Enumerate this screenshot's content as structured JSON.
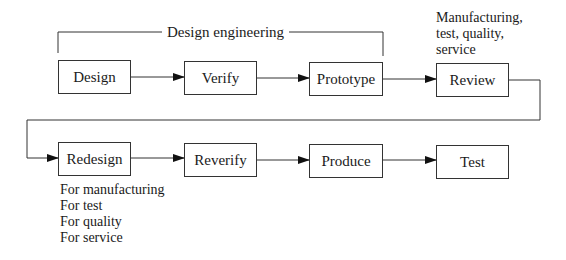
{
  "diagram": {
    "type": "flowchart",
    "bracket": {
      "label": "Design engineering"
    },
    "row1": [
      {
        "id": "design",
        "label": "Design"
      },
      {
        "id": "verify",
        "label": "Verify"
      },
      {
        "id": "prototype",
        "label": "Prototype"
      },
      {
        "id": "review",
        "label": "Review"
      }
    ],
    "row2": [
      {
        "id": "redesign",
        "label": "Redesign"
      },
      {
        "id": "reverify",
        "label": "Reverify"
      },
      {
        "id": "produce",
        "label": "Produce"
      },
      {
        "id": "test",
        "label": "Test"
      }
    ],
    "review_annotation": [
      "Manufacturing,",
      "test, quality,",
      "service"
    ],
    "redesign_annotation": [
      "For manufacturing",
      "For test",
      "For quality",
      "For service"
    ],
    "edges": [
      [
        "design",
        "verify"
      ],
      [
        "verify",
        "prototype"
      ],
      [
        "prototype",
        "review"
      ],
      [
        "review",
        "redesign"
      ],
      [
        "redesign",
        "reverify"
      ],
      [
        "reverify",
        "produce"
      ],
      [
        "produce",
        "test"
      ]
    ]
  }
}
